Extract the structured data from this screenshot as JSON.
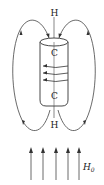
{
  "diagram": {
    "labels": {
      "top_pole": "H",
      "bottom_pole": "H",
      "cylinder_top": "C",
      "cylinder_bottom": "C",
      "applied_field": "H",
      "applied_field_subscript": "0"
    },
    "elements": {
      "cylinder": "vertical cylinder with axis line",
      "surface_current_arrows": 3,
      "field_loops": 2,
      "applied_field_arrows": 5
    },
    "colors": {
      "stroke": "#333333",
      "background": "#ffffff"
    }
  }
}
